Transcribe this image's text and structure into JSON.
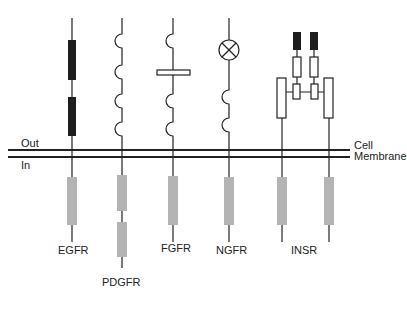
{
  "diagram": {
    "title_hint": "Receptor tyrosine kinase families",
    "labels": {
      "out": "Out",
      "in": "In",
      "membrane_line1": "Cell",
      "membrane_line2": "Membrane"
    },
    "receptors": [
      {
        "name": "EGFR",
        "x": 72
      },
      {
        "name": "PDGFR",
        "x": 122
      },
      {
        "name": "FGFR",
        "x": 173
      },
      {
        "name": "NGFR",
        "x": 229
      },
      {
        "name": "INSR",
        "x": 305
      }
    ],
    "colors": {
      "line": "#222222",
      "dark_domain": "#1e1e1e",
      "kinase_domain": "#b4b4b4",
      "background": "#ffffff"
    }
  }
}
